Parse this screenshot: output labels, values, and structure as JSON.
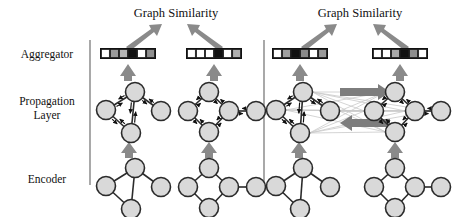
{
  "figure": {
    "caption_left": "Graph Similarity",
    "caption_right": "Graph Similarity"
  },
  "row_labels": [
    {
      "id": "aggregator",
      "label": "Aggregator",
      "lines": [
        "Aggregator"
      ]
    },
    {
      "id": "propagation",
      "label": "Propagation Layer",
      "lines": [
        "Propagation",
        "Layer"
      ]
    },
    {
      "id": "encoder",
      "label": "Encoder",
      "lines": [
        "Encoder"
      ]
    }
  ],
  "panels": [
    {
      "id": "panel-embedding-model",
      "side": "left",
      "title": "Graph Similarity",
      "cross_graph_attention": false,
      "graphs": [
        {
          "id": "graph-1",
          "node_count": 4,
          "nodes": [
            {
              "id": "n1",
              "x": 135,
              "y": 92
            },
            {
              "id": "n2",
              "x": 106,
              "y": 110
            },
            {
              "id": "n3",
              "x": 161,
              "y": 111
            },
            {
              "id": "n4",
              "x": 131,
              "y": 133
            }
          ],
          "edges": [
            [
              "n1",
              "n2"
            ],
            [
              "n1",
              "n3"
            ],
            [
              "n1",
              "n4"
            ],
            [
              "n2",
              "n4"
            ]
          ],
          "embedding_vector": {
            "id": "vector-1",
            "cell_count": 6,
            "cells": [
              "#ffffff",
              "#9a9a9a",
              "#b5b5b5",
              "#111111",
              "#ffffff",
              "#8f8f8f"
            ]
          }
        },
        {
          "id": "graph-2",
          "node_count": 5,
          "nodes": [
            {
              "id": "n1",
              "x": 209,
              "y": 92
            },
            {
              "id": "n2",
              "x": 188,
              "y": 111
            },
            {
              "id": "n3",
              "x": 229,
              "y": 111
            },
            {
              "id": "n4",
              "x": 209,
              "y": 132
            },
            {
              "id": "n5",
              "x": 256,
              "y": 111
            }
          ],
          "edges": [
            [
              "n1",
              "n2"
            ],
            [
              "n1",
              "n3"
            ],
            [
              "n2",
              "n4"
            ],
            [
              "n3",
              "n4"
            ],
            [
              "n3",
              "n5"
            ]
          ],
          "embedding_vector": {
            "id": "vector-2",
            "cell_count": 6,
            "cells": [
              "#ffffff",
              "#ffffff",
              "#ffffff",
              "#111111",
              "#ffffff",
              "#b0b0b0"
            ]
          }
        }
      ]
    },
    {
      "id": "panel-graph-matching-network",
      "side": "right",
      "title": "Graph Similarity",
      "cross_graph_attention": true,
      "graphs": [
        {
          "id": "graph-3",
          "node_count": 4,
          "nodes": [
            {
              "id": "n1",
              "x": 303,
              "y": 92
            },
            {
              "id": "n2",
              "x": 276,
              "y": 110
            },
            {
              "id": "n3",
              "x": 330,
              "y": 111
            },
            {
              "id": "n4",
              "x": 300,
              "y": 133
            }
          ],
          "edges": [
            [
              "n1",
              "n2"
            ],
            [
              "n1",
              "n3"
            ],
            [
              "n1",
              "n4"
            ],
            [
              "n2",
              "n4"
            ]
          ],
          "embedding_vector": {
            "id": "vector-3",
            "cell_count": 6,
            "cells": [
              "#ffffff",
              "#9f9f9f",
              "#111111",
              "#8a8a8a",
              "#ffffff",
              "#9a9a9a"
            ]
          }
        },
        {
          "id": "graph-4",
          "node_count": 5,
          "nodes": [
            {
              "id": "n1",
              "x": 395,
              "y": 92
            },
            {
              "id": "n2",
              "x": 374,
              "y": 111
            },
            {
              "id": "n3",
              "x": 415,
              "y": 111
            },
            {
              "id": "n4",
              "x": 395,
              "y": 132
            },
            {
              "id": "n5",
              "x": 441,
              "y": 111
            }
          ],
          "edges": [
            [
              "n1",
              "n2"
            ],
            [
              "n1",
              "n3"
            ],
            [
              "n2",
              "n4"
            ],
            [
              "n3",
              "n4"
            ],
            [
              "n3",
              "n5"
            ]
          ],
          "embedding_vector": {
            "id": "vector-4",
            "cell_count": 6,
            "cells": [
              "#ffffff",
              "#ffffff",
              "#a8a8a8",
              "#111111",
              "#8d8d8d",
              "#ffffff"
            ]
          }
        }
      ]
    }
  ],
  "colors": {
    "node_fill": "#d9d9d9",
    "node_stroke": "#2b2b2b",
    "edge": "#2b2b2b",
    "fat_arrow": "#8a8a8a",
    "cross_attention_line": "#c9c9c9",
    "divider": "#6f6f6f",
    "text": "#111111",
    "background": "#ffffff"
  }
}
